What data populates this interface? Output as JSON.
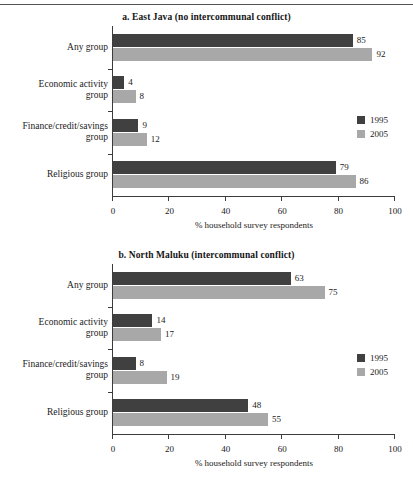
{
  "figure": {
    "has_top_rule": true,
    "x_axis_title": "% household survey respondents",
    "colors": {
      "series_1995": "#404040",
      "series_2005": "#a8a8a8",
      "axis": "#3c3c3c",
      "text": "#1a1a1a",
      "background": "#ffffff"
    },
    "legend": {
      "items": [
        {
          "label": "1995",
          "color": "#404040"
        },
        {
          "label": "2005",
          "color": "#a8a8a8"
        }
      ]
    },
    "xticks": [
      "0",
      "20",
      "40",
      "60",
      "80",
      "100"
    ]
  },
  "chart_data": [
    {
      "type": "bar",
      "orientation": "horizontal",
      "title": "a. East Java (no intercommunal conflict)",
      "xlabel": "% household survey respondents",
      "ylabel": "",
      "xlim": [
        0,
        100
      ],
      "xticks": [
        0,
        20,
        40,
        60,
        80,
        100
      ],
      "grid": false,
      "legend_position": "right-middle",
      "categories": [
        "Any group",
        "Economic activity\ngroup",
        "Finance/credit/savings\ngroup",
        "Religious group"
      ],
      "series": [
        {
          "name": "1995",
          "color": "#404040",
          "values": [
            85,
            4,
            9,
            79
          ]
        },
        {
          "name": "2005",
          "color": "#a8a8a8",
          "values": [
            92,
            8,
            12,
            86
          ]
        }
      ]
    },
    {
      "type": "bar",
      "orientation": "horizontal",
      "title": "b. North Maluku (intercommunal conflict)",
      "xlabel": "% household survey respondents",
      "ylabel": "",
      "xlim": [
        0,
        100
      ],
      "xticks": [
        0,
        20,
        40,
        60,
        80,
        100
      ],
      "grid": false,
      "legend_position": "right-middle",
      "categories": [
        "Any group",
        "Economic activity\ngroup",
        "Finance/credit/savings\ngroup",
        "Religious group"
      ],
      "series": [
        {
          "name": "1995",
          "color": "#404040",
          "values": [
            63,
            14,
            8,
            48
          ]
        },
        {
          "name": "2005",
          "color": "#a8a8a8",
          "values": [
            75,
            17,
            19,
            55
          ]
        }
      ]
    }
  ]
}
